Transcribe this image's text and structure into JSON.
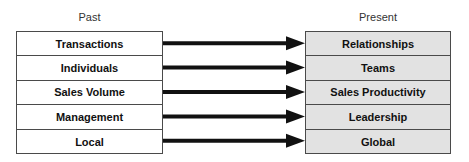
{
  "headers": {
    "past": "Past",
    "present": "Present"
  },
  "past_items": [
    "Transactions",
    "Individuals",
    "Sales Volume",
    "Management",
    "Local"
  ],
  "present_items": [
    "Relationships",
    "Teams",
    "Sales Productivity",
    "Leadership",
    "Global"
  ],
  "mappings": [
    {
      "from": "Transactions",
      "to": "Relationships"
    },
    {
      "from": "Individuals",
      "to": "Teams"
    },
    {
      "from": "Sales Volume",
      "to": "Sales Productivity"
    },
    {
      "from": "Management",
      "to": "Leadership"
    },
    {
      "from": "Local",
      "to": "Global"
    }
  ],
  "colors": {
    "past_fill": "#ffffff",
    "present_fill": "#e2e2e2",
    "border": "#4a4a4a",
    "arrow": "#111111",
    "text": "#111111",
    "header_text": "#333333"
  }
}
